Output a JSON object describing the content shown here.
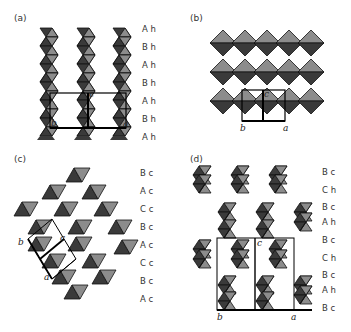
{
  "figure": {
    "colors": {
      "dark": "#3a3a3a",
      "light": "#8c8c8c",
      "edge": "#111111",
      "bg": "#ffffff"
    },
    "panels": [
      {
        "id": "a",
        "label": "(a)",
        "stacking": [
          "A h",
          "B h",
          "A h",
          "B h",
          "A h",
          "B h",
          "A h"
        ],
        "axes": {
          "b": "b",
          "c": "c",
          "a": "a"
        }
      },
      {
        "id": "b",
        "label": "(b)",
        "stacking": [],
        "axes": {
          "b": "b",
          "c": "c",
          "a": "a"
        }
      },
      {
        "id": "c",
        "label": "(c)",
        "stacking": [
          "B c",
          "A c",
          "C c",
          "B c",
          "A c",
          "C c",
          "B c",
          "A c"
        ],
        "axes": {
          "b": "b",
          "c": "c",
          "a": "a"
        }
      },
      {
        "id": "d",
        "label": "(d)",
        "stacking": [
          "B c",
          "C h",
          "B c",
          "A h",
          "B c",
          "C h",
          "B c",
          "A h",
          "B c"
        ],
        "axes": {
          "b": "b",
          "c": "c",
          "a": "a"
        }
      }
    ]
  }
}
